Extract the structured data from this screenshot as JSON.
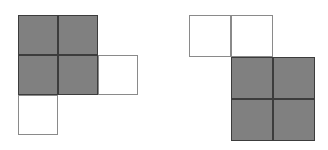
{
  "page": {
    "background_color": "#ffffff",
    "width": 328,
    "height": 150
  },
  "style": {
    "shaded_fill": "#808080",
    "shaded_border": "#3c3c3c",
    "empty_fill": "#ffffff",
    "empty_border": "#8a8a8a"
  },
  "figures": [
    {
      "name": "left-figure",
      "label": "Left polyomino",
      "origin_x": 18,
      "origin_y": 15,
      "cell_size": 40,
      "rows": 3,
      "cols": 3,
      "cells": [
        {
          "name": "cell-r0c0",
          "row": 0,
          "col": 0,
          "state": "shaded"
        },
        {
          "name": "cell-r0c1",
          "row": 0,
          "col": 1,
          "state": "shaded"
        },
        {
          "name": "cell-r1c0",
          "row": 1,
          "col": 0,
          "state": "shaded"
        },
        {
          "name": "cell-r1c1",
          "row": 1,
          "col": 1,
          "state": "shaded"
        },
        {
          "name": "cell-r1c2",
          "row": 1,
          "col": 2,
          "state": "empty"
        },
        {
          "name": "cell-r2c0",
          "row": 2,
          "col": 0,
          "state": "empty"
        }
      ]
    },
    {
      "name": "right-figure",
      "label": "Right polyomino",
      "origin_x": 189,
      "origin_y": 15,
      "cell_size": 42,
      "rows": 3,
      "cols": 3,
      "cells": [
        {
          "name": "cell-r0c0",
          "row": 0,
          "col": 0,
          "state": "empty"
        },
        {
          "name": "cell-r0c1",
          "row": 0,
          "col": 1,
          "state": "empty"
        },
        {
          "name": "cell-r1c1",
          "row": 1,
          "col": 1,
          "state": "shaded"
        },
        {
          "name": "cell-r1c2",
          "row": 1,
          "col": 2,
          "state": "shaded"
        },
        {
          "name": "cell-r2c1",
          "row": 2,
          "col": 1,
          "state": "shaded"
        },
        {
          "name": "cell-r2c2",
          "row": 2,
          "col": 2,
          "state": "shaded"
        }
      ]
    }
  ]
}
